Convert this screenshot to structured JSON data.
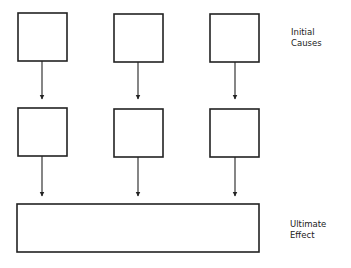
{
  "diagram": {
    "stroke_color": "#222222",
    "top_row_boxes": [
      {
        "x": 18,
        "y": 13,
        "w": 49,
        "h": 48
      },
      {
        "x": 114,
        "y": 14,
        "w": 49,
        "h": 48
      },
      {
        "x": 210,
        "y": 14,
        "w": 49,
        "h": 48
      }
    ],
    "middle_row_boxes": [
      {
        "x": 18,
        "y": 108,
        "w": 49,
        "h": 48
      },
      {
        "x": 114,
        "y": 109,
        "w": 49,
        "h": 48
      },
      {
        "x": 210,
        "y": 109,
        "w": 49,
        "h": 48
      }
    ],
    "bottom_box": {
      "x": 17,
      "y": 204,
      "w": 242,
      "h": 48
    },
    "labels": {
      "initial_causes": {
        "line1": "Initial",
        "line2": "Causes"
      },
      "ultimate_effect": {
        "line1": "Ultimate",
        "line2": "Effect"
      }
    }
  }
}
